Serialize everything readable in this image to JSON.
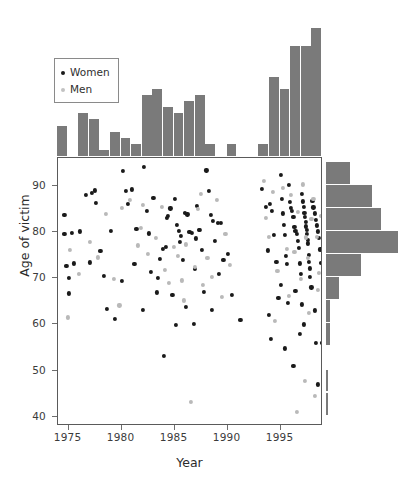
{
  "chart_data": {
    "type": "scatter",
    "title": "",
    "xlabel": "Year",
    "ylabel": "Age of victim",
    "xlim": [
      1974,
      1999
    ],
    "ylim": [
      38,
      96
    ],
    "grid": false,
    "legend_position": "top-left",
    "xticks": [
      1975,
      1980,
      1985,
      1990,
      1995
    ],
    "xtick_labels": [
      "1975",
      "1980",
      "1985",
      "1990",
      "1995"
    ],
    "yticks": [
      40,
      50,
      60,
      70,
      80,
      90
    ],
    "ytick_labels": [
      "40",
      "50",
      "60",
      "70",
      "80",
      "90"
    ],
    "series": [
      {
        "name": "Women",
        "color": "#1a1a1a",
        "points": [
          [
            1974.6,
            83.7
          ],
          [
            1974.6,
            79.5
          ],
          [
            1974.8,
            72.6
          ],
          [
            1975.0,
            70.0
          ],
          [
            1975.0,
            66.7
          ],
          [
            1975.3,
            79.8
          ],
          [
            1975.5,
            73.2
          ],
          [
            1976.1,
            80.1
          ],
          [
            1976.6,
            88.1
          ],
          [
            1977.2,
            88.5
          ],
          [
            1977.5,
            89.0
          ],
          [
            1977.6,
            86.3
          ],
          [
            1978.3,
            70.5
          ],
          [
            1978.6,
            63.4
          ],
          [
            1979.0,
            80.3
          ],
          [
            1979.4,
            61.2
          ],
          [
            1980.1,
            93.2
          ],
          [
            1980.4,
            88.8
          ],
          [
            1980.6,
            86.1
          ],
          [
            1981.0,
            89.2
          ],
          [
            1981.4,
            80.6
          ],
          [
            1982.1,
            94.1
          ],
          [
            1982.4,
            84.6
          ],
          [
            1982.6,
            79.7
          ],
          [
            1983.0,
            87.4
          ],
          [
            1983.3,
            66.9
          ],
          [
            1983.4,
            70.1
          ],
          [
            1983.6,
            74.2
          ],
          [
            1984.0,
            53.2
          ],
          [
            1984.3,
            83.0
          ],
          [
            1984.4,
            83.4
          ],
          [
            1984.6,
            85.1
          ],
          [
            1985.0,
            87.2
          ],
          [
            1985.2,
            81.5
          ],
          [
            1985.4,
            80.2
          ],
          [
            1985.6,
            79.1
          ],
          [
            1985.8,
            73.9
          ],
          [
            1986.0,
            84.1
          ],
          [
            1986.2,
            83.8
          ],
          [
            1986.4,
            80.0
          ],
          [
            1986.6,
            79.8
          ],
          [
            1986.9,
            72.0
          ],
          [
            1987.1,
            85.7
          ],
          [
            1987.3,
            80.5
          ],
          [
            1987.4,
            80.4
          ],
          [
            1987.6,
            76.1
          ],
          [
            1987.8,
            67.0
          ],
          [
            1988.0,
            93.3
          ],
          [
            1988.2,
            88.9
          ],
          [
            1988.4,
            83.7
          ],
          [
            1988.6,
            82.3
          ],
          [
            1988.8,
            78.0
          ],
          [
            1989.1,
            82.0
          ],
          [
            1989.4,
            81.9
          ],
          [
            1989.6,
            74.0
          ],
          [
            1990.0,
            75.2
          ],
          [
            1990.4,
            66.3
          ],
          [
            1991.2,
            61.0
          ],
          [
            1993.2,
            89.4
          ],
          [
            1993.6,
            85.4
          ],
          [
            1993.8,
            76.0
          ],
          [
            1994.0,
            86.0
          ],
          [
            1994.2,
            84.5
          ],
          [
            1994.4,
            79.3
          ],
          [
            1994.6,
            73.6
          ],
          [
            1994.8,
            65.8
          ],
          [
            1995.0,
            92.4
          ],
          [
            1995.1,
            87.2
          ],
          [
            1995.2,
            84.0
          ],
          [
            1995.3,
            81.5
          ],
          [
            1995.4,
            79.4
          ],
          [
            1995.5,
            74.9
          ],
          [
            1995.6,
            73.1
          ],
          [
            1995.7,
            64.7
          ],
          [
            1995.8,
            90.1
          ],
          [
            1995.9,
            86.5
          ],
          [
            1996.0,
            85.2
          ],
          [
            1996.1,
            84.6
          ],
          [
            1996.2,
            83.2
          ],
          [
            1996.3,
            81.1
          ],
          [
            1996.4,
            80.3
          ],
          [
            1996.5,
            79.5
          ],
          [
            1996.6,
            78.1
          ],
          [
            1996.7,
            76.6
          ],
          [
            1996.8,
            73.2
          ],
          [
            1996.9,
            71.0
          ],
          [
            1997.0,
            88.2
          ],
          [
            1997.1,
            86.6
          ],
          [
            1997.2,
            85.5
          ],
          [
            1997.25,
            84.2
          ],
          [
            1997.3,
            83.3
          ],
          [
            1997.35,
            82.2
          ],
          [
            1997.4,
            81.2
          ],
          [
            1997.45,
            80.4
          ],
          [
            1997.5,
            79.6
          ],
          [
            1997.55,
            78.3
          ],
          [
            1997.6,
            77.5
          ],
          [
            1997.65,
            75.0
          ],
          [
            1997.7,
            73.5
          ],
          [
            1997.75,
            72.1
          ],
          [
            1997.8,
            70.3
          ],
          [
            1997.9,
            68.0
          ],
          [
            1998.0,
            86.8
          ],
          [
            1998.1,
            85.3
          ],
          [
            1998.2,
            84.0
          ],
          [
            1998.3,
            82.6
          ],
          [
            1998.4,
            81.4
          ],
          [
            1998.5,
            80.1
          ],
          [
            1998.6,
            78.7
          ],
          [
            1998.7,
            76.2
          ],
          [
            1998.8,
            73.3
          ],
          [
            1998.9,
            56.0
          ],
          [
            1994.1,
            56.8
          ],
          [
            1995.4,
            54.8
          ],
          [
            1996.2,
            51.0
          ],
          [
            1996.8,
            58.0
          ],
          [
            1997.2,
            60.0
          ],
          [
            1998.3,
            55.9
          ],
          [
            1998.5,
            47.0
          ],
          [
            1993.9,
            62.1
          ],
          [
            1995.0,
            68.5
          ],
          [
            1996.4,
            67.2
          ],
          [
            1997.0,
            64.3
          ],
          [
            1998.2,
            63.0
          ],
          [
            1983.9,
            76.4
          ],
          [
            1986.1,
            63.7
          ],
          [
            1988.5,
            63.1
          ],
          [
            1989.2,
            70.9
          ],
          [
            1984.8,
            66.4
          ],
          [
            1982.8,
            71.3
          ],
          [
            1981.2,
            73.0
          ],
          [
            1980.0,
            69.4
          ],
          [
            1978.0,
            75.9
          ],
          [
            1977.0,
            73.4
          ],
          [
            1982.0,
            63.2
          ],
          [
            1985.1,
            59.9
          ],
          [
            1986.8,
            60.1
          ],
          [
            1984.2,
            76.8
          ],
          [
            1985.5,
            77.9
          ],
          [
            1987.0,
            78.6
          ]
        ]
      },
      {
        "name": "Men",
        "color": "#b9b9b9",
        "points": [
          [
            1975.1,
            76.1
          ],
          [
            1976.0,
            71.0
          ],
          [
            1977.0,
            77.8
          ],
          [
            1977.8,
            74.5
          ],
          [
            1978.5,
            83.9
          ],
          [
            1979.3,
            69.9
          ],
          [
            1980.0,
            85.2
          ],
          [
            1980.8,
            87.0
          ],
          [
            1981.5,
            77.1
          ],
          [
            1982.0,
            85.8
          ],
          [
            1982.5,
            75.3
          ],
          [
            1983.2,
            78.7
          ],
          [
            1983.8,
            85.5
          ],
          [
            1984.1,
            71.8
          ],
          [
            1984.5,
            68.9
          ],
          [
            1984.9,
            76.7
          ],
          [
            1985.3,
            74.8
          ],
          [
            1985.7,
            69.5
          ],
          [
            1986.1,
            77.3
          ],
          [
            1986.5,
            43.3
          ],
          [
            1986.9,
            72.5
          ],
          [
            1987.2,
            84.9
          ],
          [
            1987.7,
            68.6
          ],
          [
            1988.1,
            74.4
          ],
          [
            1988.5,
            70.2
          ],
          [
            1989.0,
            86.9
          ],
          [
            1989.5,
            65.9
          ],
          [
            1990.2,
            72.8
          ],
          [
            1993.4,
            91.0
          ],
          [
            1993.9,
            78.9
          ],
          [
            1994.3,
            88.6
          ],
          [
            1994.7,
            71.5
          ],
          [
            1995.2,
            89.6
          ],
          [
            1995.6,
            76.3
          ],
          [
            1996.0,
            88.0
          ],
          [
            1996.3,
            75.7
          ],
          [
            1996.6,
            84.3
          ],
          [
            1996.9,
            69.8
          ],
          [
            1997.1,
            90.3
          ],
          [
            1997.4,
            78.8
          ],
          [
            1997.6,
            74.3
          ],
          [
            1997.9,
            82.9
          ],
          [
            1998.1,
            87.1
          ],
          [
            1998.4,
            79.0
          ],
          [
            1998.6,
            71.2
          ],
          [
            1998.8,
            83.5
          ],
          [
            1996.5,
            41.0
          ],
          [
            1997.3,
            47.8
          ],
          [
            1998.2,
            44.6
          ],
          [
            1994.5,
            60.8
          ],
          [
            1995.8,
            66.1
          ],
          [
            1997.7,
            62.4
          ],
          [
            1974.9,
            61.5
          ],
          [
            1979.8,
            64.1
          ],
          [
            1981.8,
            80.8
          ],
          [
            1985.9,
            65.2
          ],
          [
            1987.5,
            88.3
          ],
          [
            1989.8,
            79.6
          ],
          [
            1993.6,
            83.1
          ],
          [
            1998.5,
            67.5
          ]
        ]
      }
    ],
    "marginal_top": {
      "orientation": "vertical",
      "axis": "year",
      "bin_width": 1,
      "bin_starts": [
        1974,
        1975,
        1976,
        1977,
        1978,
        1979,
        1980,
        1981,
        1982,
        1983,
        1984,
        1985,
        1986,
        1987,
        1988,
        1989,
        1990,
        1991,
        1992,
        1993,
        1994,
        1995,
        1996,
        1997,
        1998
      ],
      "counts": [
        5,
        0,
        7,
        6,
        1,
        4,
        3,
        2,
        10,
        11,
        8,
        7,
        9,
        10,
        2,
        0,
        2,
        0,
        0,
        2,
        13,
        11,
        18,
        18,
        21,
        12
      ],
      "color": "#7a7a7a"
    },
    "marginal_right": {
      "orientation": "horizontal",
      "axis": "age",
      "bin_width": 5,
      "bin_starts": [
        90,
        85,
        80,
        75,
        70,
        65,
        60,
        55,
        50,
        45,
        40
      ],
      "counts": [
        11,
        21,
        25,
        33,
        16,
        6,
        2,
        2,
        0,
        1,
        1
      ],
      "color": "#7a7a7a"
    }
  },
  "legend": {
    "items": [
      {
        "label": "Women",
        "color": "#1a1a1a"
      },
      {
        "label": "Men",
        "color": "#c2c2c2"
      }
    ]
  },
  "axes": {
    "x_title": "Year",
    "y_title": "Age of victim",
    "x_tick_labels": [
      "1975",
      "1980",
      "1985",
      "1990",
      "1995"
    ],
    "y_tick_labels": [
      "90",
      "80",
      "70",
      "60",
      "50",
      "40"
    ]
  }
}
